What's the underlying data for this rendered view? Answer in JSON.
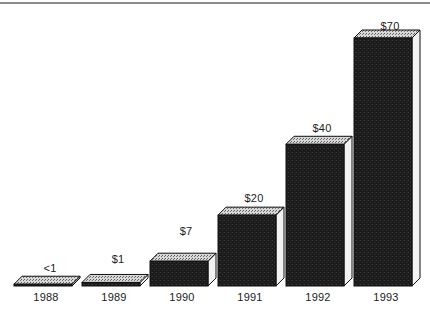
{
  "chart_data": {
    "type": "bar",
    "title": "",
    "xlabel": "",
    "ylabel": "",
    "categories": [
      "1988",
      "1989",
      "1990",
      "1991",
      "1992",
      "1993"
    ],
    "values": [
      0.5,
      1,
      7,
      20,
      40,
      70
    ],
    "data_labels": [
      "<1",
      "$1",
      "$7",
      "$20",
      "$40",
      "$70"
    ],
    "ylim": [
      0,
      70
    ],
    "grid": false,
    "legend": "none",
    "style": "3d-bar",
    "colors": {
      "bar_front": "#1c1c1c",
      "bar_top": "#b4b4b4",
      "bar_side": "#f2f2f2",
      "outline": "#111111",
      "text": "#1a1a1a",
      "rule": "#8a8a8a",
      "background": "#ffffff"
    }
  },
  "axis": {
    "tick_labels": [
      "1988",
      "1989",
      "1990",
      "1991",
      "1992",
      "1993"
    ]
  },
  "labels": {
    "bar_1988": "<1",
    "bar_1989": "$1",
    "bar_1990": "$7",
    "bar_1991": "$20",
    "bar_1992": "$40",
    "bar_1993": "$70"
  }
}
